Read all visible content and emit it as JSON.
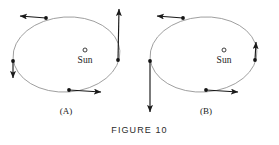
{
  "figure": {
    "caption": "FIGURE 10",
    "background_color": "#ffffff",
    "orbit_stroke_color": "#8a8a8a",
    "vector_color": "#1a1a1a",
    "point_color": "#141414"
  },
  "panels": [
    {
      "label": "(A)",
      "label_x": 66,
      "label_y": 114,
      "sun": {
        "label": "Sun",
        "marker_x": 85,
        "marker_y": 50,
        "marker_r": 2.0,
        "label_x": 85,
        "label_y": 63
      },
      "orbit": {
        "cx": 66.5,
        "cy": 54.5,
        "rx": 53.5,
        "ry": 37.5,
        "rotation": -4
      },
      "vectors": [
        {
          "name": "top-vector",
          "point_x": 46,
          "point_y": 18,
          "tip_x": 20,
          "tip_y": 16,
          "direction": "left",
          "length_class": "medium"
        },
        {
          "name": "right-vector",
          "point_x": 118,
          "point_y": 60,
          "tip_x": 119,
          "tip_y": 9,
          "direction": "up",
          "length_class": "long"
        },
        {
          "name": "left-vector",
          "point_x": 13,
          "point_y": 61,
          "tip_x": 13,
          "tip_y": 78,
          "direction": "down",
          "length_class": "short"
        },
        {
          "name": "bottom-vector",
          "point_x": 69,
          "point_y": 90,
          "tip_x": 101,
          "tip_y": 92,
          "direction": "right",
          "length_class": "medium"
        }
      ]
    },
    {
      "label": "(B)",
      "label_x": 206,
      "label_y": 114,
      "sun": {
        "label": "Sun",
        "marker_x": 224,
        "marker_y": 50,
        "marker_r": 2.0,
        "label_x": 224,
        "label_y": 63
      },
      "orbit": {
        "cx": 203.5,
        "cy": 54.5,
        "rx": 53.5,
        "ry": 37.5,
        "rotation": -4
      },
      "vectors": [
        {
          "name": "top-vector",
          "point_x": 183,
          "point_y": 18,
          "tip_x": 157,
          "tip_y": 16,
          "direction": "left",
          "length_class": "medium"
        },
        {
          "name": "right-vector",
          "point_x": 255,
          "point_y": 60,
          "tip_x": 256,
          "tip_y": 42,
          "direction": "up",
          "length_class": "short"
        },
        {
          "name": "left-vector",
          "point_x": 150,
          "point_y": 61,
          "tip_x": 150,
          "tip_y": 112,
          "direction": "down",
          "length_class": "long"
        },
        {
          "name": "bottom-vector",
          "point_x": 206,
          "point_y": 90,
          "tip_x": 238,
          "tip_y": 92,
          "direction": "right",
          "length_class": "medium"
        }
      ]
    }
  ]
}
